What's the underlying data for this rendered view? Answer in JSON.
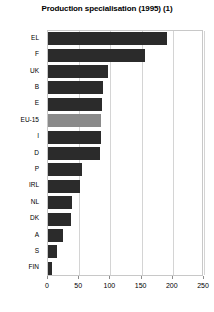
{
  "chart_data": {
    "type": "bar",
    "orientation": "horizontal",
    "title": "Production specialisation (1995) (1)",
    "xlabel": "",
    "ylabel": "",
    "xlim": [
      0,
      250
    ],
    "ylim": null,
    "grid": true,
    "legend": false,
    "xticks": [
      0,
      50,
      100,
      150,
      200,
      250
    ],
    "categories": [
      "EL",
      "F",
      "UK",
      "B",
      "E",
      "EU-15",
      "I",
      "D",
      "P",
      "IRL",
      "NL",
      "DK",
      "A",
      "S",
      "FIN"
    ],
    "values": [
      190,
      155,
      96,
      88,
      86,
      85,
      85,
      84,
      55,
      52,
      39,
      37,
      24,
      15,
      7
    ],
    "highlight_category": "EU-15",
    "colors": {
      "bar": "#2b2b2b",
      "bar_highlight": "#8a8a8a",
      "grid": "#d4d4d4",
      "frame": "#c8c8c8",
      "text": "#000000",
      "background": "#ffffff"
    }
  }
}
